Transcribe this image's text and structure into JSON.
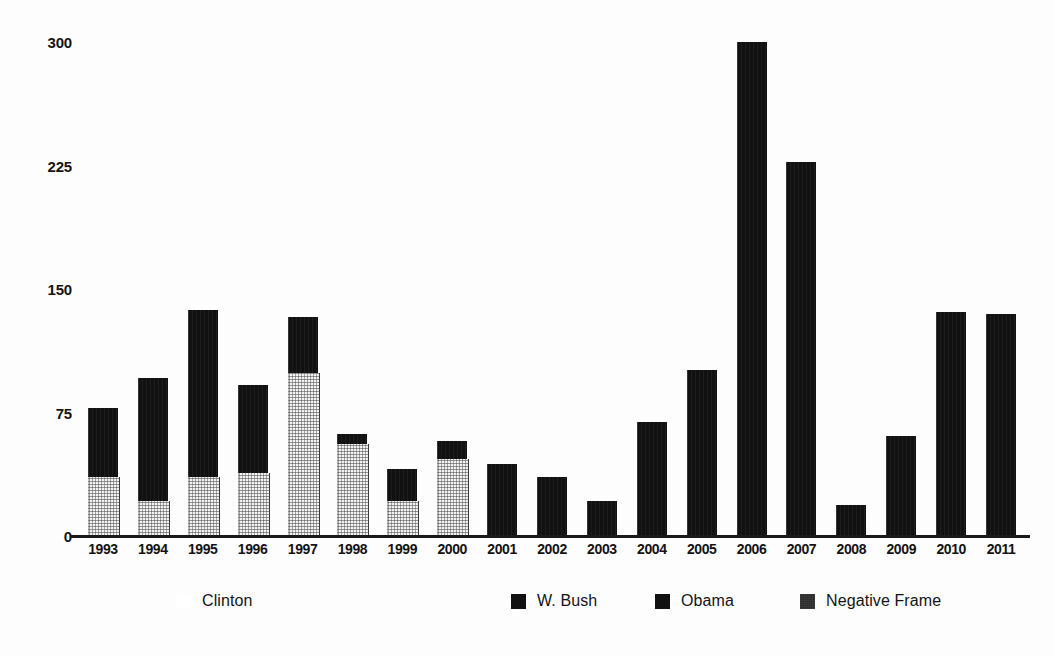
{
  "chart_data": {
    "type": "bar",
    "title": "",
    "subtitle": "",
    "xlabel": "",
    "ylabel": "",
    "ylim": [
      0,
      300
    ],
    "yticks": [
      "0",
      "75",
      "150",
      "225",
      "300"
    ],
    "ytick_values": [
      0,
      75,
      150,
      225,
      300
    ],
    "grid": false,
    "legend_position": "bottom",
    "stacked": true,
    "categories": [
      "1993",
      "1994",
      "1995",
      "1996",
      "1997",
      "1998",
      "1999",
      "2000",
      "2001",
      "2002",
      "2003",
      "2004",
      "2005",
      "2006",
      "2007",
      "2008",
      "2009",
      "2010",
      "2011"
    ],
    "series": [
      {
        "name": "Total Coverage",
        "values": [
          78,
          96,
          137,
          92,
          133,
          62,
          41,
          58,
          44,
          36,
          21,
          69,
          101,
          300,
          227,
          19,
          61,
          136,
          135
        ]
      },
      {
        "name": "Negative Frame",
        "values": [
          36,
          21,
          36,
          38,
          99,
          56,
          21,
          47,
          0,
          0,
          0,
          0,
          0,
          0,
          0,
          0,
          0,
          0,
          0
        ]
      }
    ],
    "administrations": [
      {
        "name": "Clinton",
        "years": [
          "1993",
          "1994",
          "1995",
          "1996",
          "1997",
          "1998",
          "1999",
          "2000"
        ]
      },
      {
        "name": "W. Bush",
        "years": [
          "2001",
          "2002",
          "2003",
          "2004",
          "2005",
          "2006",
          "2007",
          "2008"
        ]
      },
      {
        "name": "Obama",
        "years": [
          "2009",
          "2010",
          "2011"
        ]
      }
    ],
    "annotations": []
  },
  "legend": {
    "items": [
      {
        "label": "Clinton",
        "swatch": "light",
        "color": "#ffffff"
      },
      {
        "label": "W. Bush",
        "swatch": "dark",
        "color": "#111111"
      },
      {
        "label": "Obama",
        "swatch": "dark",
        "color": "#111111"
      },
      {
        "label": "Negative Frame",
        "swatch": "grain",
        "color": "#2b2b2b"
      }
    ]
  },
  "colors": {
    "bar_dark": "#111111",
    "bar_negative": "#f2f2f2",
    "axis": "#1a1a1a",
    "text": "#141414",
    "background": "#fdfdfd"
  }
}
